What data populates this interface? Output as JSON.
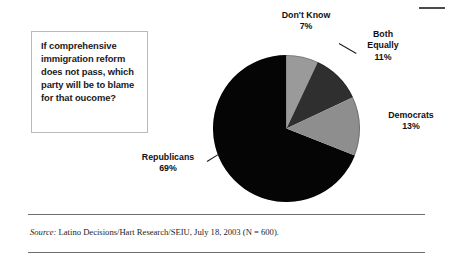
{
  "figure": {
    "question_box": {
      "text": "If comprehensive immigration reform does not pass, which party will be to blame for that oucome?"
    },
    "source": {
      "label": "Source:",
      "text": " Latino Decisions/Hart Research/SEIU, July 18, 2003 (N = 600)."
    }
  },
  "chart_data": {
    "type": "pie",
    "title": "",
    "subtitle": "",
    "xlabel": "",
    "ylabel": "",
    "legend_position": "none",
    "grid": false,
    "start_angle_deg": 0,
    "direction": "clockwise",
    "units": "percent",
    "categories": [
      "Don't Know",
      "Both Equally",
      "Democrats",
      "Republicans"
    ],
    "values": [
      7,
      11,
      13,
      69
    ],
    "value_labels": [
      "7%",
      "11%",
      "13%",
      "69%"
    ],
    "colors": [
      "#9a9a9a",
      "#2f2f2f",
      "#8e8e8e",
      "#050505"
    ],
    "slices": [
      {
        "name": "Don't Know",
        "value": 7,
        "label": "Don't Know",
        "pct_label": "7%",
        "color": "#9a9a9a"
      },
      {
        "name": "Both Equally",
        "value": 11,
        "label": "Both Equally",
        "pct_label": "11%",
        "color": "#2f2f2f"
      },
      {
        "name": "Democrats",
        "value": 13,
        "label": "Democrats",
        "pct_label": "13%",
        "color": "#8e8e8e"
      },
      {
        "name": "Republicans",
        "value": 69,
        "label": "Republicans",
        "pct_label": "69%",
        "color": "#050505"
      }
    ],
    "labels": {
      "dont_know": {
        "name": "Don't Know",
        "pct": "7%"
      },
      "both_equally": {
        "name_line1": "Both",
        "name_line2": "Equally",
        "pct": "11%"
      },
      "democrats": {
        "name": "Democrats",
        "pct": "13%"
      },
      "republicans": {
        "name": "Republicans",
        "pct": "69%"
      }
    }
  }
}
